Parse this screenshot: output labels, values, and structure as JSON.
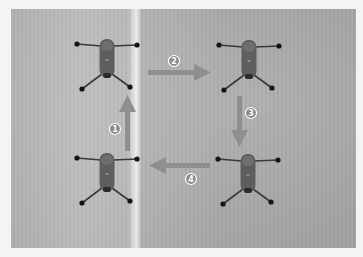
{
  "diagram": {
    "colors": {
      "arrow": "#8f8f8f",
      "badge_fill": "#8a8a8a",
      "badge_stroke": "#ffffff",
      "drone_body": "#5c5c5c",
      "drone_arm": "#3a3a3a",
      "prop_dot": "#151515"
    },
    "steps": [
      {
        "number": "1",
        "direction": "up",
        "label": "Step 1"
      },
      {
        "number": "2",
        "direction": "right",
        "label": "Step 2"
      },
      {
        "number": "3",
        "direction": "down",
        "label": "Step 3"
      },
      {
        "number": "4",
        "direction": "left",
        "label": "Step 4"
      }
    ],
    "drones": [
      {
        "position": "top-left"
      },
      {
        "position": "top-right"
      },
      {
        "position": "bottom-left"
      },
      {
        "position": "bottom-right"
      }
    ]
  }
}
